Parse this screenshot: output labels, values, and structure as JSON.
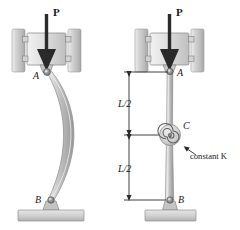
{
  "figure": {
    "background_color": "#ffffff",
    "ink_color": "#1a1a1a",
    "metal_light": "#e8e8e8",
    "metal_mid": "#c9c9c9",
    "metal_dark": "#9a9a9a",
    "panels": [
      {
        "id": "left",
        "caption": "buckled-column",
        "load_label": "P",
        "top_joint_label": "A",
        "bottom_joint_label": "B"
      },
      {
        "id": "right",
        "caption": "column-with-torsional-spring",
        "load_label": "P",
        "top_joint_label": "A",
        "mid_joint_label": "C",
        "bottom_joint_label": "B",
        "dimension_upper": "L/2",
        "dimension_lower": "L/2",
        "spring_label": "constant K"
      }
    ]
  }
}
